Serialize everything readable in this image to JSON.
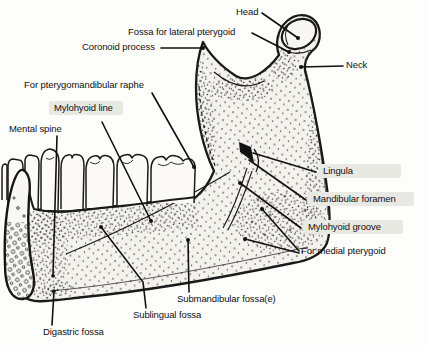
{
  "figure": {
    "type": "anatomical-line-drawing"
  },
  "colors": {
    "ink": "#1a1a1a",
    "bone_fill": "#f3f2ed",
    "tooth_fill": "#fbfaf7",
    "label_highlight": "#e8e9e3",
    "background": "#fdfdfb"
  },
  "labels": [
    {
      "id": "head",
      "text": "Head",
      "highlighted": false
    },
    {
      "id": "fossa-lateral",
      "text": "Fossa for lateral pterygoid",
      "highlighted": false
    },
    {
      "id": "coronoid-process",
      "text": "Coronoid process",
      "highlighted": false
    },
    {
      "id": "neck",
      "text": "Neck",
      "highlighted": false
    },
    {
      "id": "pterygomandibular-raphe",
      "text": "For pterygomandibular raphe",
      "highlighted": false
    },
    {
      "id": "mylohyoid-line",
      "text": "Mylohyoid line",
      "highlighted": true
    },
    {
      "id": "mental-spine",
      "text": "Mental spine",
      "highlighted": false
    },
    {
      "id": "lingula",
      "text": "Lingula",
      "highlighted": true
    },
    {
      "id": "mandibular-foramen",
      "text": "Mandibular foramen",
      "highlighted": true
    },
    {
      "id": "mylohyoid-groove",
      "text": "Mylohyoid groove",
      "highlighted": true
    },
    {
      "id": "for-medial-pterygoid",
      "text": "For medial pterygoid",
      "highlighted": false
    },
    {
      "id": "submandibular-fossa",
      "text": "Submandibular fossa(e)",
      "highlighted": false
    },
    {
      "id": "sublingual-fossa",
      "text": "Sublingual fossa",
      "highlighted": false
    },
    {
      "id": "digastric-fossa",
      "text": "Digastric fossa",
      "highlighted": false
    }
  ]
}
